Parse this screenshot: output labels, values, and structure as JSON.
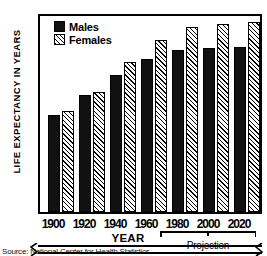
{
  "chart_data": {
    "type": "bar",
    "title": "",
    "xlabel": "YEAR",
    "ylabel": "LIFE EXPECTANCY IN YEARS",
    "categories": [
      "1900",
      "1920",
      "1940",
      "1960",
      "1980",
      "2000",
      "2020"
    ],
    "series": [
      {
        "name": "Males",
        "values": [
          46.5,
          53.5,
          60.5,
          66.0,
          69.0,
          69.5,
          70.0
        ]
      },
      {
        "name": "Females",
        "values": [
          48.0,
          54.5,
          65.0,
          72.5,
          77.0,
          78.0,
          78.5
        ]
      }
    ],
    "ylim": [
      30,
      80
    ],
    "yticks": [
      "80",
      "70",
      "60",
      "50",
      "40",
      "30"
    ],
    "ytick_values": [
      80,
      70,
      60,
      50,
      40,
      30
    ],
    "axis_break": true,
    "axis_break_note": "y-axis broken below 30",
    "grid": false,
    "legend_position": "top-left",
    "annotations": [
      {
        "text": "Projection",
        "covers": [
          "1980",
          "2000",
          "2020"
        ]
      }
    ]
  },
  "legend": {
    "males_label": "Males",
    "females_label": "Females"
  },
  "axes": {
    "y_title": "LIFE EXPECTANCY IN YEARS",
    "x_title": "YEAR"
  },
  "annotation": {
    "projection_label": "Projection"
  },
  "source": {
    "text": "Source: National Center for Health Statistics"
  },
  "colors": {
    "males_fill": "#111111",
    "females_fill": "#ffffff",
    "outline": "#000000",
    "background": "#ffffff"
  }
}
